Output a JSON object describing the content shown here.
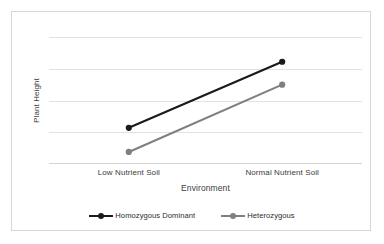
{
  "top_cutoff_text": "",
  "chart_data": {
    "type": "line",
    "title": "",
    "subtitle": "",
    "xlabel": "Environment",
    "ylabel": "Plant Height",
    "categories": [
      "Low Nutrient Soil",
      "Normal Nutrient Soil"
    ],
    "grid": "horizontal",
    "gridline_count": 5,
    "xlim": [
      0,
      1
    ],
    "ylim": [
      0,
      1
    ],
    "y_tick_labels": [],
    "legend_position": "bottom-center",
    "annotations": [],
    "series": [
      {
        "name": "Homozygous Dominant",
        "color": "#1a1a1a",
        "marker": "circle",
        "values": [
          0.285,
          0.805
        ]
      },
      {
        "name": "Heterozygous",
        "color": "#7f7f7f",
        "marker": "circle",
        "values": [
          0.095,
          0.625
        ]
      }
    ]
  },
  "frame": {
    "border_color": "#d7d7d7",
    "background": "#ffffff"
  }
}
